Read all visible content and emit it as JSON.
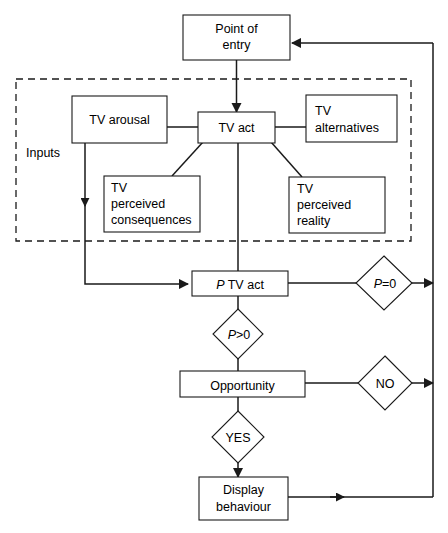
{
  "diagram": {
    "colors": {
      "stroke": "#1a1a1a",
      "fill": "#ffffff",
      "text": "#000000"
    },
    "group": {
      "label": "Inputs"
    },
    "nodes": {
      "point_of_entry": {
        "line1": "Point of",
        "line2": "entry"
      },
      "tv_arousal": {
        "line1": "TV arousal"
      },
      "tv_act": {
        "line1": "TV act"
      },
      "tv_alternatives": {
        "line1": "TV",
        "line2": "alternatives"
      },
      "tv_perceived_consequences": {
        "line1": "TV",
        "line2": "perceived",
        "line3": "consequences"
      },
      "tv_perceived_reality": {
        "line1": "TV",
        "line2": "perceived",
        "line3": "reality"
      },
      "p_tv_act": {
        "italic_prefix": "P",
        "rest": " TV act"
      },
      "opportunity": {
        "line1": "Opportunity"
      },
      "display_behaviour": {
        "line1": "Display",
        "line2": "behaviour"
      }
    },
    "decisions": {
      "p_equals_zero": {
        "italic_prefix": "P",
        "rest": "=0"
      },
      "p_greater_zero": {
        "italic_prefix": "P",
        "rest": ">0"
      },
      "no": {
        "label": "NO"
      },
      "yes": {
        "label": "YES"
      }
    }
  }
}
